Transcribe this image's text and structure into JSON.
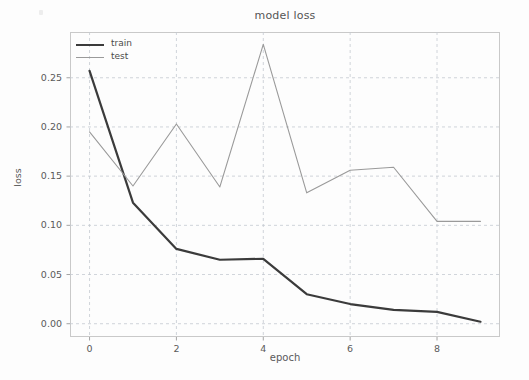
{
  "figure": {
    "title": "model loss",
    "xlabel": "epoch",
    "ylabel": "loss"
  },
  "axes": {
    "y_ticks": [
      "0.00",
      "0.05",
      "0.10",
      "0.15",
      "0.20",
      "0.25"
    ],
    "x_ticks": [
      "0",
      "2",
      "4",
      "6",
      "8"
    ]
  },
  "legend": {
    "items": [
      {
        "label": "train",
        "color": "#3b3b3b"
      },
      {
        "label": "test",
        "color": "#9a9a9a"
      }
    ]
  },
  "chart_data": {
    "type": "line",
    "title": "model loss",
    "xlabel": "epoch",
    "ylabel": "loss",
    "x": [
      0,
      1,
      2,
      3,
      4,
      5,
      6,
      7,
      8,
      9
    ],
    "xlim": [
      -0.45,
      9.45
    ],
    "ylim": [
      -0.0135,
      0.2965
    ],
    "xticks": [
      0,
      2,
      4,
      6,
      8
    ],
    "yticks": [
      0.0,
      0.05,
      0.1,
      0.15,
      0.2,
      0.25
    ],
    "grid": true,
    "legend_position": "upper left",
    "series": [
      {
        "name": "train",
        "color": "#3b3b3b",
        "linewidth": 2.2,
        "values": [
          0.257,
          0.123,
          0.076,
          0.065,
          0.066,
          0.03,
          0.02,
          0.014,
          0.012,
          0.002
        ]
      },
      {
        "name": "test",
        "color": "#9a9a9a",
        "linewidth": 1.1,
        "values": [
          0.195,
          0.14,
          0.203,
          0.139,
          0.284,
          0.133,
          0.156,
          0.159,
          0.104,
          0.104
        ]
      }
    ]
  }
}
